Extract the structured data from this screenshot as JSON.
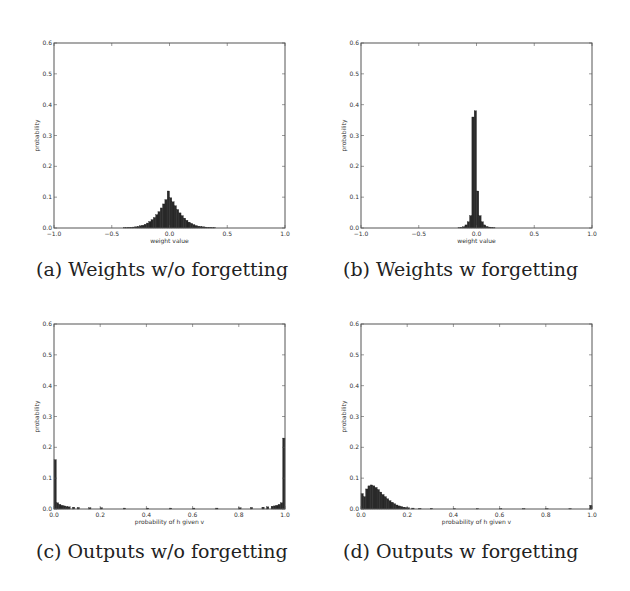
{
  "chart_data": [
    {
      "id": "a",
      "type": "bar",
      "caption": "(a) Weights w/o forgetting",
      "xlabel": "weight value",
      "ylabel": "probability",
      "xlim": [
        -1.0,
        1.0
      ],
      "ylim": [
        0.0,
        0.6
      ],
      "xticks": [
        "-1.0",
        "-0.5",
        "0.0",
        "0.5",
        "1.0"
      ],
      "xtick_values": [
        -1.0,
        -0.5,
        0.0,
        0.5,
        1.0
      ],
      "yticks": [
        "0.0",
        "0.1",
        "0.2",
        "0.3",
        "0.4",
        "0.5",
        "0.6"
      ],
      "grid": false,
      "bin_width": 0.02,
      "x": [
        -0.4,
        -0.38,
        -0.36,
        -0.34,
        -0.32,
        -0.3,
        -0.28,
        -0.26,
        -0.24,
        -0.22,
        -0.2,
        -0.18,
        -0.16,
        -0.14,
        -0.12,
        -0.1,
        -0.08,
        -0.06,
        -0.04,
        -0.02,
        0.0,
        0.02,
        0.04,
        0.06,
        0.08,
        0.1,
        0.12,
        0.14,
        0.16,
        0.18,
        0.2,
        0.22,
        0.24,
        0.26,
        0.28,
        0.3,
        0.32,
        0.34,
        0.36,
        0.38
      ],
      "values": [
        0.001,
        0.001,
        0.002,
        0.002,
        0.003,
        0.004,
        0.005,
        0.007,
        0.009,
        0.012,
        0.016,
        0.021,
        0.027,
        0.034,
        0.043,
        0.053,
        0.065,
        0.078,
        0.092,
        0.12,
        0.098,
        0.085,
        0.072,
        0.06,
        0.049,
        0.04,
        0.032,
        0.025,
        0.019,
        0.015,
        0.011,
        0.008,
        0.006,
        0.005,
        0.004,
        0.003,
        0.002,
        0.002,
        0.001,
        0.001
      ]
    },
    {
      "id": "b",
      "type": "bar",
      "caption": "(b) Weights w forgetting",
      "xlabel": "weight value",
      "ylabel": "probability",
      "xlim": [
        -1.0,
        1.0
      ],
      "ylim": [
        0.0,
        0.6
      ],
      "xticks": [
        "-1.0",
        "-0.5",
        "0.0",
        "0.5",
        "1.0"
      ],
      "xtick_values": [
        -1.0,
        -0.5,
        0.0,
        0.5,
        1.0
      ],
      "yticks": [
        "0.0",
        "0.1",
        "0.2",
        "0.3",
        "0.4",
        "0.5",
        "0.6"
      ],
      "grid": false,
      "bin_width": 0.02,
      "x": [
        -0.16,
        -0.14,
        -0.12,
        -0.1,
        -0.08,
        -0.06,
        -0.04,
        -0.02,
        0.0,
        0.02,
        0.04,
        0.06,
        0.08,
        0.1,
        0.12,
        0.14
      ],
      "values": [
        0.001,
        0.002,
        0.004,
        0.01,
        0.02,
        0.04,
        0.36,
        0.38,
        0.12,
        0.04,
        0.02,
        0.01,
        0.005,
        0.003,
        0.002,
        0.001
      ]
    },
    {
      "id": "c",
      "type": "bar",
      "caption": "(c) Outputs w/o forgetting",
      "xlabel": "probability of h given v",
      "ylabel": "probability",
      "xlim": [
        0.0,
        1.0
      ],
      "ylim": [
        0.0,
        0.6
      ],
      "xticks": [
        "0.0",
        "0.2",
        "0.4",
        "0.6",
        "0.8",
        "1.0"
      ],
      "xtick_values": [
        0.0,
        0.2,
        0.4,
        0.6,
        0.8,
        1.0
      ],
      "yticks": [
        "0.0",
        "0.1",
        "0.2",
        "0.3",
        "0.4",
        "0.5",
        "0.6"
      ],
      "grid": false,
      "bin_width": 0.01,
      "x": [
        0.0,
        0.01,
        0.02,
        0.03,
        0.04,
        0.05,
        0.06,
        0.08,
        0.1,
        0.15,
        0.2,
        0.3,
        0.4,
        0.5,
        0.6,
        0.7,
        0.8,
        0.85,
        0.9,
        0.92,
        0.94,
        0.95,
        0.96,
        0.97,
        0.98,
        0.99
      ],
      "values": [
        0.16,
        0.02,
        0.015,
        0.012,
        0.01,
        0.008,
        0.007,
        0.006,
        0.005,
        0.004,
        0.004,
        0.003,
        0.003,
        0.003,
        0.003,
        0.003,
        0.004,
        0.005,
        0.006,
        0.007,
        0.009,
        0.01,
        0.012,
        0.015,
        0.02,
        0.23
      ]
    },
    {
      "id": "d",
      "type": "bar",
      "caption": "(d) Outputs w forgetting",
      "xlabel": "probability of h given v",
      "ylabel": "probability",
      "xlim": [
        0.0,
        1.0
      ],
      "ylim": [
        0.0,
        0.6
      ],
      "xticks": [
        "0.0",
        "0.2",
        "0.4",
        "0.6",
        "0.8",
        "1.0"
      ],
      "xtick_values": [
        0.0,
        0.2,
        0.4,
        0.6,
        0.8,
        1.0
      ],
      "yticks": [
        "0.0",
        "0.1",
        "0.2",
        "0.3",
        "0.4",
        "0.5",
        "0.6"
      ],
      "grid": false,
      "bin_width": 0.01,
      "x": [
        0.0,
        0.01,
        0.02,
        0.03,
        0.04,
        0.05,
        0.06,
        0.07,
        0.08,
        0.09,
        0.1,
        0.11,
        0.12,
        0.13,
        0.14,
        0.15,
        0.16,
        0.17,
        0.18,
        0.19,
        0.2,
        0.22,
        0.25,
        0.3,
        0.4,
        0.5,
        0.6,
        0.7,
        0.8,
        0.9,
        0.99
      ],
      "values": [
        0.05,
        0.04,
        0.065,
        0.075,
        0.078,
        0.075,
        0.07,
        0.063,
        0.055,
        0.047,
        0.04,
        0.033,
        0.027,
        0.022,
        0.017,
        0.013,
        0.01,
        0.008,
        0.006,
        0.005,
        0.004,
        0.003,
        0.002,
        0.002,
        0.001,
        0.001,
        0.001,
        0.001,
        0.001,
        0.001,
        0.012
      ]
    }
  ],
  "captions": {
    "a": "(a) Weights w/o forgetting",
    "b": "(b) Weights w forgetting",
    "c": "(c) Outputs w/o forgetting",
    "d": "(d) Outputs w forgetting"
  },
  "colors": {
    "bar": "#2a2a2a",
    "frame": "#555555",
    "text": "#222222"
  }
}
